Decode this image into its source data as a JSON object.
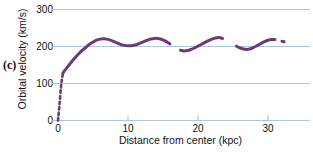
{
  "figure": {
    "panel_label": "(c)",
    "background_color": "#ffffff"
  },
  "chart_data": {
    "type": "line",
    "title": "",
    "xlabel": "Distance from center (kpc)",
    "ylabel": "Orbital velocity (km/s)",
    "xlim": [
      0,
      35
    ],
    "ylim": [
      0,
      300
    ],
    "xticks": [
      0,
      10,
      20,
      30
    ],
    "xtick_labels": [
      "0",
      "10",
      "20",
      "30"
    ],
    "yticks": [
      0,
      100,
      200,
      300
    ],
    "ytick_labels": [
      "0",
      "100",
      "200",
      "300"
    ],
    "grid": true,
    "grid_color": "#a9c6dd",
    "legend": "none",
    "line_color": "#6d3b74",
    "series": [
      {
        "name": "rotation curve (extrapolated inner rise)",
        "style": "dashed",
        "x": [
          0.0,
          0.2,
          0.4,
          0.55,
          0.7
        ],
        "values": [
          0,
          40,
          85,
          110,
          128
        ]
      },
      {
        "name": "rotation curve (measured)",
        "style": "solid-with-gaps",
        "x": [
          0.7,
          1.0,
          1.5,
          2.0,
          2.5,
          3.0,
          3.5,
          4.0,
          4.5,
          5.0,
          5.5,
          6.0,
          6.5,
          7.0,
          7.5,
          8.0,
          8.5,
          9.0,
          9.5,
          10.0,
          10.5,
          11.0,
          11.5,
          12.0,
          12.5,
          13.0,
          13.5,
          14.0,
          14.5,
          15.0,
          15.5,
          16.0,
          16.5,
          17.0,
          17.5,
          18.0,
          18.5,
          19.0,
          19.5,
          20.0,
          20.5,
          21.0,
          21.5,
          22.0,
          22.5,
          23.0,
          23.5,
          24.0,
          24.5,
          25.0,
          25.5,
          26.0,
          26.5,
          27.0,
          27.5,
          28.0,
          28.5,
          29.0,
          29.5,
          30.0,
          30.5,
          31.0,
          31.5,
          32.0,
          32.3
        ],
        "values": [
          128,
          136,
          148,
          160,
          171,
          181,
          190,
          198,
          206,
          212,
          217,
          220,
          221,
          220,
          217,
          213,
          209,
          205,
          203,
          202,
          202,
          204,
          207,
          211,
          215,
          219,
          221,
          222,
          221,
          218,
          213,
          207,
          200,
          194,
          190,
          188,
          189,
          192,
          196,
          201,
          206,
          211,
          216,
          220,
          223,
          224,
          222,
          218,
          213,
          207,
          201,
          196,
          193,
          192,
          194,
          198,
          203,
          208,
          213,
          217,
          219,
          219,
          217,
          214,
          213
        ],
        "gaps": [
          {
            "from": 16.4,
            "to": 17.2
          },
          {
            "from": 17.6,
            "to": 17.9
          },
          {
            "from": 23.6,
            "to": 24.3
          },
          {
            "from": 24.8,
            "to": 25.3
          },
          {
            "from": 31.4,
            "to": 31.9
          }
        ]
      }
    ]
  }
}
